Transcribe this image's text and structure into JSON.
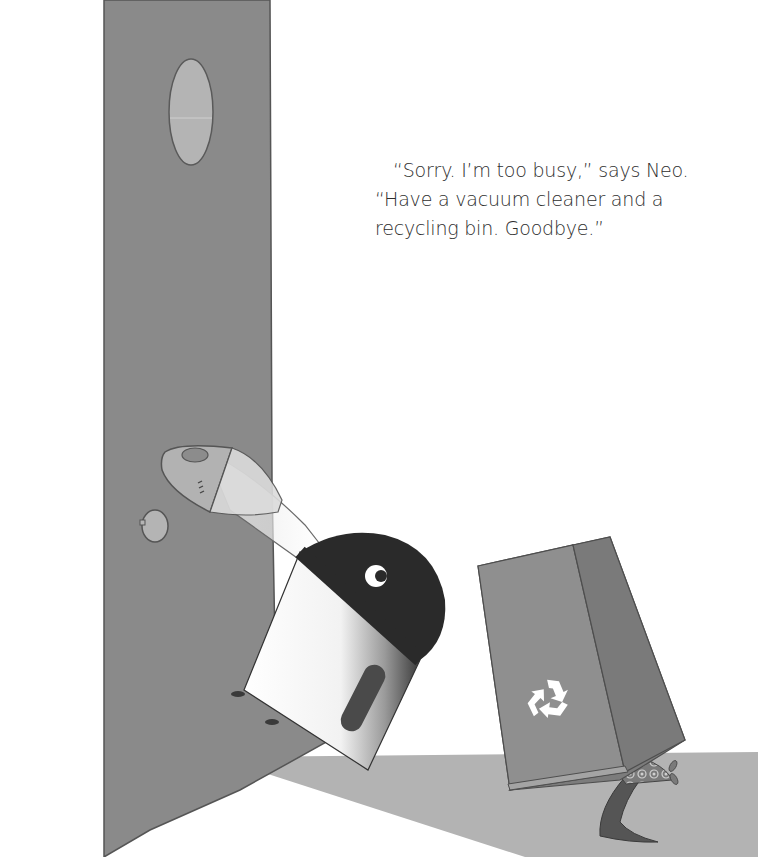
{
  "page": {
    "type": "picture-book-illustration",
    "caption": {
      "lines": [
        "“Sorry. I’m too busy,” says Neo.",
        "“Have a vacuum cleaner and a",
        "recycling bin. Goodbye.”"
      ]
    }
  },
  "illustration": {
    "elements": {
      "door": "tall gray door panel with oval window and knob",
      "vacuum": "vacuum cleaner character with dark head, eye and white body",
      "hose": "translucent vacuum hose with nozzle",
      "recycling_bin": "tilted gray recycling bin with recycle symbol",
      "creature": "small creature under the bin with patterned shell and curved tail",
      "floor": "gray floor wedge"
    },
    "colors": {
      "background": "#ffffff",
      "door": "#8a8a8a",
      "door_window": "#b4b4b4",
      "vacuum_head": "#2a2a2a",
      "vacuum_body": "#f4f4f4",
      "bin_front": "#8f8f8f",
      "bin_side": "#7c7c7c",
      "floor": "#b3b3b3",
      "text": "#2e2e2e"
    }
  }
}
